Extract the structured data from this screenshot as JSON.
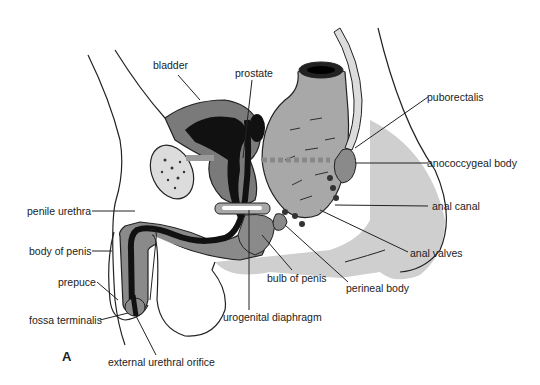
{
  "figure": {
    "panel_letter": "A",
    "colors": {
      "dark_tissue": "#111111",
      "mid_gray": "#7a7a7a",
      "light_gray": "#c9c9c9",
      "rectum_gray": "#a8a8a8",
      "outline": "#222222"
    }
  },
  "labels": {
    "bladder": "bladder",
    "prostate": "prostate",
    "puborectalis": "puborectalis",
    "anococcygeal_body": "anococcygeal body",
    "penile_urethra": "penile urethra",
    "anal_canal": "anal canal",
    "body_of_penis": "body of penis",
    "anal_valves": "anal valves",
    "bulb_of_penis": "bulb of penis",
    "prepuce": "prepuce",
    "perineal_body": "perineal body",
    "urogenital_diaphragm": "urogenital diaphragm",
    "fossa_terminalis": "fossa terminalis",
    "external_urethral_orifice": "external urethral orifice"
  }
}
